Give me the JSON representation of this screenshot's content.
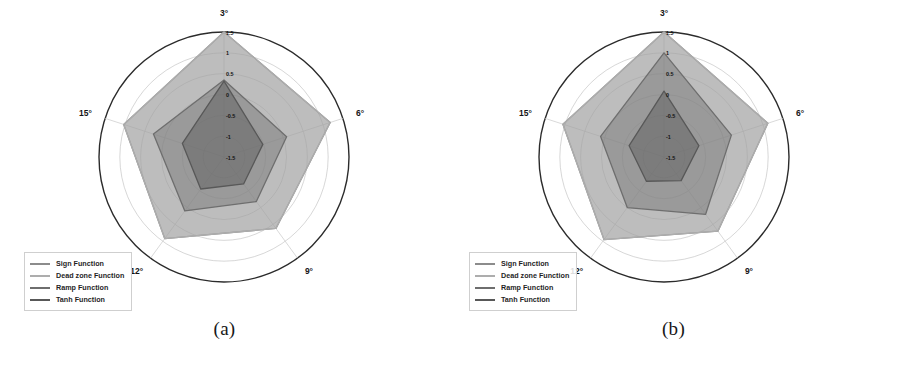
{
  "figure": {
    "subfigures": [
      {
        "caption": "(a)",
        "id": "chart-a"
      },
      {
        "caption": "(b)",
        "id": "chart-b"
      }
    ]
  },
  "legend": {
    "position": "bottom-left",
    "items": [
      {
        "label": "Sign Function",
        "color": "#8c8c8c"
      },
      {
        "label": "Dead zone Function",
        "color": "#adadad"
      },
      {
        "label": "Ramp Function",
        "color": "#6e6e6e"
      },
      {
        "label": "Tanh Function",
        "color": "#585858"
      }
    ]
  },
  "axis": {
    "angle_labels": [
      "3°",
      "6°",
      "9°",
      "12°",
      "15°"
    ],
    "radial_ticks": [
      "1.5",
      "1",
      "0.5",
      "0",
      "-0.5",
      "-1",
      "-1.5"
    ],
    "rlim": [
      -1.5,
      1.5
    ]
  },
  "chart_data": [
    {
      "type": "radar",
      "title": "(a)",
      "categories": [
        "3°",
        "6°",
        "9°",
        "12°",
        "15°"
      ],
      "rlim": [
        -1.5,
        1.5
      ],
      "radial_ticks": [
        1.5,
        1,
        0.5,
        0,
        -0.5,
        -1,
        -1.5
      ],
      "grid": true,
      "legend_position": "bottom-left",
      "series": [
        {
          "name": "Sign Function",
          "color": "#8c8c8c",
          "values": [
            1.5,
            1.18,
            0.62,
            0.92,
            1.03
          ]
        },
        {
          "name": "Dead zone Function",
          "color": "#adadad",
          "values": [
            1.5,
            1.18,
            0.62,
            0.92,
            1.03
          ]
        },
        {
          "name": "Ramp Function",
          "color": "#6e6e6e",
          "values": [
            0.35,
            0.08,
            -0.18,
            0.1,
            0.28
          ]
        },
        {
          "name": "Tanh Function",
          "color": "#585858",
          "values": [
            0.32,
            -0.52,
            -0.7,
            -0.55,
            -0.45
          ]
        }
      ]
    },
    {
      "type": "radar",
      "title": "(b)",
      "categories": [
        "3°",
        "6°",
        "9°",
        "12°",
        "15°"
      ],
      "rlim": [
        -1.5,
        1.5
      ],
      "radial_ticks": [
        1.5,
        1,
        0.5,
        0,
        -0.5,
        -1,
        -1.5
      ],
      "grid": true,
      "legend_position": "bottom-left",
      "series": [
        {
          "name": "Sign Function",
          "color": "#8c8c8c",
          "values": [
            1.5,
            1.12,
            0.7,
            0.95,
            1.05
          ]
        },
        {
          "name": "Dead zone Function",
          "color": "#adadad",
          "values": [
            1.5,
            1.12,
            0.7,
            0.95,
            1.05
          ]
        },
        {
          "name": "Ramp Function",
          "color": "#6e6e6e",
          "values": [
            1.0,
            0.2,
            0.2,
            0.0,
            0.1
          ]
        },
        {
          "name": "Tanh Function",
          "color": "#585858",
          "values": [
            0.08,
            -0.62,
            -0.8,
            -0.78,
            -0.62
          ]
        }
      ]
    }
  ]
}
